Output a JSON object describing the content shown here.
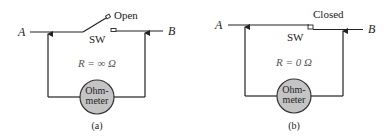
{
  "panels": [
    {
      "id": "a",
      "caption": "(a)",
      "node_left": "A",
      "node_right": "B",
      "switch_label": "SW",
      "switch_state": "Open",
      "resistance": "R = ∞ Ω",
      "meter_line1": "Ohm-",
      "meter_line2": "meter"
    },
    {
      "id": "b",
      "caption": "(b)",
      "node_left": "A",
      "node_right": "B",
      "switch_label": "SW",
      "switch_state": "Closed",
      "resistance": "R = 0 Ω",
      "meter_line1": "Ohm-",
      "meter_line2": "meter"
    }
  ],
  "colors": {
    "wire": "#222222",
    "meter_fill": "#c4c4c4",
    "resistance_text": "#555555"
  }
}
